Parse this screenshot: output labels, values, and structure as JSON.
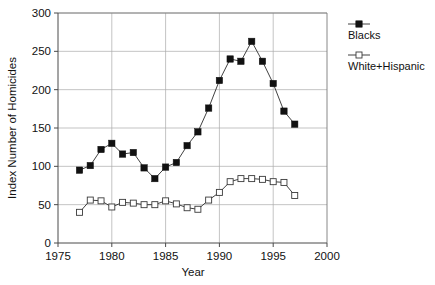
{
  "chart_data": {
    "type": "line",
    "title": "",
    "xlabel": "Year",
    "ylabel": "Index Number of Homicides",
    "xlim": [
      1975,
      2000
    ],
    "ylim": [
      0,
      300
    ],
    "xticks": [
      1975,
      1980,
      1985,
      1990,
      1995,
      2000
    ],
    "xtick_labels": [
      "1975",
      "1980",
      "1985",
      "1990",
      "1995",
      "2000"
    ],
    "yticks": [
      0,
      50,
      100,
      150,
      200,
      250,
      300
    ],
    "ytick_labels": [
      "0",
      "50",
      "100",
      "150",
      "200",
      "250",
      "300"
    ],
    "grid": true,
    "legend_position": "right",
    "x": [
      1977,
      1978,
      1979,
      1980,
      1981,
      1982,
      1983,
      1984,
      1985,
      1986,
      1987,
      1988,
      1989,
      1990,
      1991,
      1992,
      1993,
      1994,
      1995,
      1996,
      1997
    ],
    "series": [
      {
        "name": "Blacks",
        "marker": "filled-square",
        "color": "#111111",
        "values": [
          95,
          101,
          122,
          130,
          116,
          118,
          98,
          84,
          99,
          105,
          127,
          145,
          176,
          212,
          240,
          237,
          263,
          237,
          208,
          172,
          155
        ]
      },
      {
        "name": "White+Hispanic",
        "marker": "open-square",
        "color": "#3a3a3a",
        "values": [
          40,
          56,
          55,
          47,
          53,
          52,
          50,
          50,
          55,
          51,
          46,
          44,
          56,
          66,
          80,
          84,
          84,
          83,
          80,
          79,
          62
        ]
      }
    ]
  },
  "legend": {
    "items": [
      {
        "label": "Blacks"
      },
      {
        "label": "White+Hispanic"
      }
    ]
  },
  "axes": {
    "x_title": "Year",
    "y_title": "Index Number of Homicides"
  }
}
